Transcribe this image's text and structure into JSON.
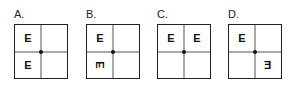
{
  "options": [
    {
      "label": "A.",
      "cells": {
        "tl": "E",
        "tr": "",
        "bl": "E",
        "br": ""
      }
    },
    {
      "label": "B.",
      "cells": {
        "tl": "E",
        "tr": "",
        "bl": "E",
        "br": ""
      }
    },
    {
      "label": "C.",
      "cells": {
        "tl": "E",
        "tr": "E",
        "bl": "",
        "br": ""
      }
    },
    {
      "label": "D.",
      "cells": {
        "tl": "E",
        "tr": "",
        "bl": "",
        "br": "E"
      }
    }
  ]
}
